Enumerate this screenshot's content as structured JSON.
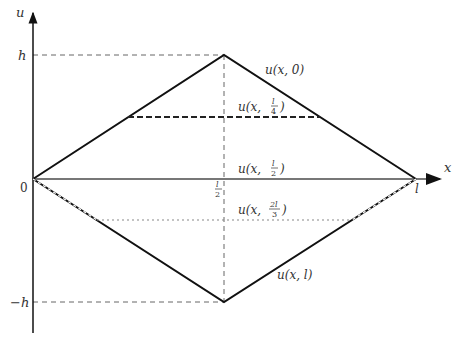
{
  "diagram": {
    "axes": {
      "x_label": "x",
      "y_label": "u",
      "origin_label": "0",
      "x_end_label": "l",
      "x_mid_label": "l/2",
      "y_top_label": "h",
      "y_bottom_label": "−h"
    },
    "curves": [
      {
        "name": "u(x,0)",
        "label": "u(x, 0)",
        "style": "solid"
      },
      {
        "name": "u(x,l/4)",
        "label": "u(x, l/4)",
        "style": "dashed"
      },
      {
        "name": "u(x,l/2)",
        "label": "u(x, l/2)",
        "style": "solid-gray"
      },
      {
        "name": "u(x,2l/3)",
        "label": "u(x, 2l/3)",
        "style": "dotted"
      },
      {
        "name": "u(x,l)",
        "label": "u(x, l)",
        "style": "solid"
      }
    ],
    "label_parts": {
      "u0_prefix": "u(x, 0)",
      "ul4_prefix": "u(x, ",
      "ul4_num": "l",
      "ul4_den": "4",
      "ul2_prefix": "u(x, ",
      "ul2_num": "l",
      "ul2_den": "2",
      "u2l3_prefix": "u(x, ",
      "u2l3_num": "2l",
      "u2l3_den": "3",
      "ul_label": "u(x, l)",
      "close_paren": ")"
    }
  }
}
